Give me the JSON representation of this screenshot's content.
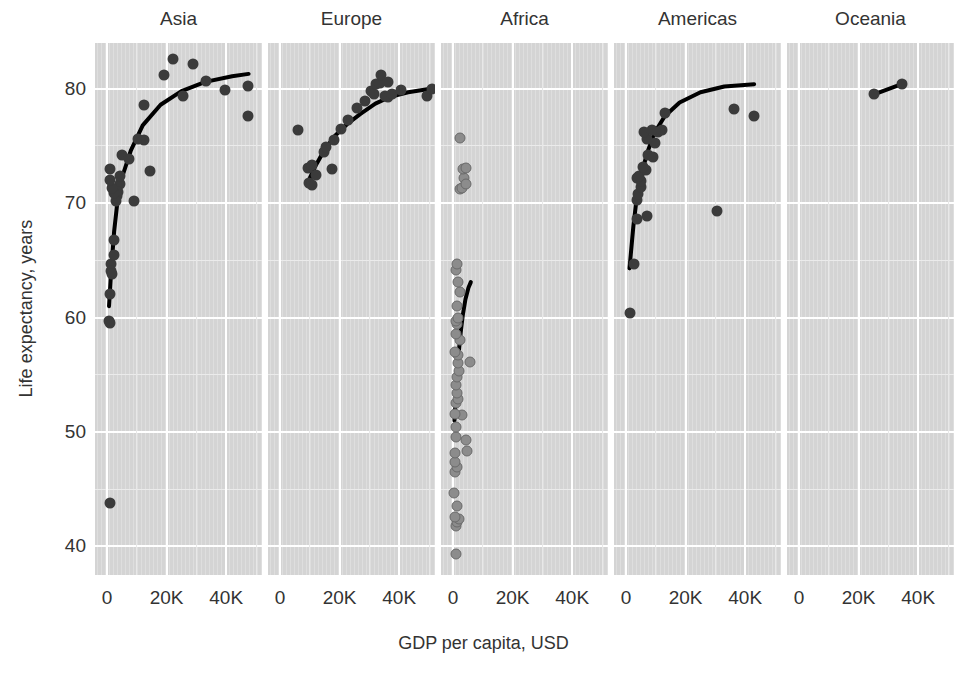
{
  "chart_data": {
    "type": "scatter",
    "title": "",
    "xlabel": "GDP per capita, USD",
    "ylabel": "Life expectancy, years",
    "xlim": [
      -4000,
      52000
    ],
    "ylim": [
      37.5,
      84
    ],
    "xticks": [
      0,
      20000,
      40000
    ],
    "xticklabels": [
      "0",
      "20K",
      "40K"
    ],
    "yticks": [
      40,
      50,
      60,
      70,
      80
    ],
    "yticklabels": [
      "40",
      "50",
      "60",
      "70",
      "80"
    ],
    "grid": true,
    "legend": "none",
    "facet_by": "continent",
    "point_color_dark": "#3b3b3b",
    "point_color_mid": "#8c8c8c",
    "trend_color": "#000000",
    "panel_background": "#d4d4d4",
    "gridline_color": "#ffffff",
    "facets": [
      {
        "name": "Asia",
        "label": "Asia",
        "point_style": "dark",
        "points": [
          {
            "x": 975,
            "y": 43.8
          },
          {
            "x": 1391,
            "y": 64.7
          },
          {
            "x": 1441,
            "y": 64.1
          },
          {
            "x": 944,
            "y": 62.1
          },
          {
            "x": 2452,
            "y": 65.5
          },
          {
            "x": 1593,
            "y": 63.8
          },
          {
            "x": 706,
            "y": 59.7
          },
          {
            "x": 1056,
            "y": 59.5
          },
          {
            "x": 2441,
            "y": 66.8
          },
          {
            "x": 3540,
            "y": 70.6
          },
          {
            "x": 4471,
            "y": 71.7
          },
          {
            "x": 4519,
            "y": 72.4
          },
          {
            "x": 3823,
            "y": 71.0
          },
          {
            "x": 2983,
            "y": 70.2
          },
          {
            "x": 2280,
            "y": 70.9
          },
          {
            "x": 1713,
            "y": 71.3
          },
          {
            "x": 1107,
            "y": 72.0
          },
          {
            "x": 1042,
            "y": 73.0
          },
          {
            "x": 4959,
            "y": 74.2
          },
          {
            "x": 7458,
            "y": 73.9
          },
          {
            "x": 10461,
            "y": 75.6
          },
          {
            "x": 12452,
            "y": 75.5
          },
          {
            "x": 14599,
            "y": 72.8
          },
          {
            "x": 9065,
            "y": 70.2
          },
          {
            "x": 12546,
            "y": 78.6
          },
          {
            "x": 18977,
            "y": 81.2
          },
          {
            "x": 22316,
            "y": 82.6
          },
          {
            "x": 28718,
            "y": 82.2
          },
          {
            "x": 25523,
            "y": 79.4
          },
          {
            "x": 33207,
            "y": 80.7
          },
          {
            "x": 39725,
            "y": 79.9
          },
          {
            "x": 47307,
            "y": 80.2
          },
          {
            "x": 47143,
            "y": 77.6
          }
        ],
        "trend": [
          {
            "x": 700,
            "y": 61.0
          },
          {
            "x": 1400,
            "y": 64.0
          },
          {
            "x": 2400,
            "y": 67.5
          },
          {
            "x": 3600,
            "y": 70.3
          },
          {
            "x": 5000,
            "y": 72.2
          },
          {
            "x": 8000,
            "y": 74.6
          },
          {
            "x": 12000,
            "y": 76.8
          },
          {
            "x": 18000,
            "y": 78.6
          },
          {
            "x": 25000,
            "y": 79.8
          },
          {
            "x": 33000,
            "y": 80.6
          },
          {
            "x": 42000,
            "y": 81.1
          },
          {
            "x": 47500,
            "y": 81.3
          }
        ]
      },
      {
        "name": "Europe",
        "label": "Europe",
        "point_style": "dark",
        "points": [
          {
            "x": 5937,
            "y": 76.4
          },
          {
            "x": 9786,
            "y": 71.8
          },
          {
            "x": 10681,
            "y": 71.6
          },
          {
            "x": 9410,
            "y": 73.1
          },
          {
            "x": 10808,
            "y": 73.3
          },
          {
            "x": 12154,
            "y": 72.5
          },
          {
            "x": 14619,
            "y": 74.5
          },
          {
            "x": 15463,
            "y": 74.9
          },
          {
            "x": 17356,
            "y": 73.0
          },
          {
            "x": 18008,
            "y": 75.5
          },
          {
            "x": 20510,
            "y": 76.5
          },
          {
            "x": 22833,
            "y": 77.3
          },
          {
            "x": 25768,
            "y": 78.3
          },
          {
            "x": 28569,
            "y": 78.9
          },
          {
            "x": 30470,
            "y": 79.8
          },
          {
            "x": 31656,
            "y": 79.5
          },
          {
            "x": 32170,
            "y": 80.4
          },
          {
            "x": 33693,
            "y": 80.5
          },
          {
            "x": 33860,
            "y": 81.2
          },
          {
            "x": 35278,
            "y": 79.4
          },
          {
            "x": 36126,
            "y": 79.3
          },
          {
            "x": 36181,
            "y": 80.6
          },
          {
            "x": 37506,
            "y": 79.5
          },
          {
            "x": 40676,
            "y": 79.9
          },
          {
            "x": 49357,
            "y": 79.4
          },
          {
            "x": 51000,
            "y": 80.0
          }
        ],
        "trend": [
          {
            "x": 9500,
            "y": 71.9
          },
          {
            "x": 12000,
            "y": 73.3
          },
          {
            "x": 15000,
            "y": 74.7
          },
          {
            "x": 18500,
            "y": 75.9
          },
          {
            "x": 22500,
            "y": 76.9
          },
          {
            "x": 27000,
            "y": 77.8
          },
          {
            "x": 32000,
            "y": 78.7
          },
          {
            "x": 37000,
            "y": 79.3
          },
          {
            "x": 43000,
            "y": 79.7
          },
          {
            "x": 50500,
            "y": 80.0
          }
        ]
      },
      {
        "name": "Africa",
        "label": "Africa",
        "point_style": "mid",
        "points": [
          {
            "x": 863,
            "y": 39.3
          },
          {
            "x": 1056,
            "y": 41.8
          },
          {
            "x": 1217,
            "y": 42.1
          },
          {
            "x": 2013,
            "y": 42.4
          },
          {
            "x": 690,
            "y": 42.6
          },
          {
            "x": 1271,
            "y": 43.5
          },
          {
            "x": 430,
            "y": 44.7
          },
          {
            "x": 613,
            "y": 46.5
          },
          {
            "x": 1271,
            "y": 46.9
          },
          {
            "x": 706,
            "y": 47.4
          },
          {
            "x": 823,
            "y": 48.2
          },
          {
            "x": 4797,
            "y": 48.3
          },
          {
            "x": 4513,
            "y": 49.3
          },
          {
            "x": 1056,
            "y": 49.6
          },
          {
            "x": 1178,
            "y": 50.4
          },
          {
            "x": 3025,
            "y": 51.5
          },
          {
            "x": 641,
            "y": 51.6
          },
          {
            "x": 926,
            "y": 52.5
          },
          {
            "x": 1544,
            "y": 52.9
          },
          {
            "x": 1327,
            "y": 53.4
          },
          {
            "x": 1093,
            "y": 54.1
          },
          {
            "x": 1271,
            "y": 54.8
          },
          {
            "x": 2082,
            "y": 55.3
          },
          {
            "x": 1598,
            "y": 56.0
          },
          {
            "x": 1544,
            "y": 56.7
          },
          {
            "x": 619,
            "y": 57.0
          },
          {
            "x": 2452,
            "y": 58.0
          },
          {
            "x": 5581,
            "y": 56.1
          },
          {
            "x": 1107,
            "y": 58.6
          },
          {
            "x": 1441,
            "y": 59.4
          },
          {
            "x": 863,
            "y": 59.7
          },
          {
            "x": 1569,
            "y": 60.0
          },
          {
            "x": 1327,
            "y": 61.0
          },
          {
            "x": 2280,
            "y": 62.2
          },
          {
            "x": 1598,
            "y": 63.1
          },
          {
            "x": 944,
            "y": 64.2
          },
          {
            "x": 1217,
            "y": 64.7
          },
          {
            "x": 2441,
            "y": 71.2
          },
          {
            "x": 2983,
            "y": 71.3
          },
          {
            "x": 3822,
            "y": 72.2
          },
          {
            "x": 4472,
            "y": 71.7
          },
          {
            "x": 3540,
            "y": 73.0
          },
          {
            "x": 4519,
            "y": 73.1
          },
          {
            "x": 2441,
            "y": 75.7
          }
        ],
        "trend": [
          {
            "x": 500,
            "y": 51.0
          },
          {
            "x": 800,
            "y": 52.4
          },
          {
            "x": 1100,
            "y": 53.8
          },
          {
            "x": 1500,
            "y": 55.4
          },
          {
            "x": 2000,
            "y": 57.1
          },
          {
            "x": 2600,
            "y": 58.7
          },
          {
            "x": 3300,
            "y": 60.2
          },
          {
            "x": 4200,
            "y": 61.6
          },
          {
            "x": 5200,
            "y": 62.6
          },
          {
            "x": 6000,
            "y": 63.1
          }
        ]
      },
      {
        "name": "Americas",
        "label": "Americas",
        "point_style": "dark",
        "points": [
          {
            "x": 1201,
            "y": 60.4
          },
          {
            "x": 2749,
            "y": 64.7
          },
          {
            "x": 3548,
            "y": 68.6
          },
          {
            "x": 3822,
            "y": 70.3
          },
          {
            "x": 4172,
            "y": 70.8
          },
          {
            "x": 4959,
            "y": 71.4
          },
          {
            "x": 5186,
            "y": 71.9
          },
          {
            "x": 3632,
            "y": 72.2
          },
          {
            "x": 4519,
            "y": 72.4
          },
          {
            "x": 7009,
            "y": 68.9
          },
          {
            "x": 6873,
            "y": 72.9
          },
          {
            "x": 5728,
            "y": 73.2
          },
          {
            "x": 7320,
            "y": 74.2
          },
          {
            "x": 8948,
            "y": 74.0
          },
          {
            "x": 9645,
            "y": 75.3
          },
          {
            "x": 7006,
            "y": 75.6
          },
          {
            "x": 5937,
            "y": 76.2
          },
          {
            "x": 8796,
            "y": 76.4
          },
          {
            "x": 10611,
            "y": 76.2
          },
          {
            "x": 11978,
            "y": 76.4
          },
          {
            "x": 13171,
            "y": 77.9
          },
          {
            "x": 36319,
            "y": 78.2
          },
          {
            "x": 42952,
            "y": 77.6
          },
          {
            "x": 30487,
            "y": 69.3
          }
        ],
        "trend": [
          {
            "x": 1200,
            "y": 64.3
          },
          {
            "x": 2500,
            "y": 68.0
          },
          {
            "x": 3600,
            "y": 70.4
          },
          {
            "x": 5000,
            "y": 72.3
          },
          {
            "x": 7000,
            "y": 74.3
          },
          {
            "x": 9500,
            "y": 76.1
          },
          {
            "x": 13000,
            "y": 77.6
          },
          {
            "x": 18000,
            "y": 78.8
          },
          {
            "x": 25000,
            "y": 79.7
          },
          {
            "x": 33000,
            "y": 80.2
          },
          {
            "x": 43000,
            "y": 80.4
          }
        ]
      },
      {
        "name": "Oceania",
        "label": "Oceania",
        "point_style": "dark",
        "points": [
          {
            "x": 25185,
            "y": 79.5
          },
          {
            "x": 34435,
            "y": 80.4
          }
        ],
        "trend": [
          {
            "x": 25185,
            "y": 79.5
          },
          {
            "x": 34435,
            "y": 80.4
          }
        ]
      }
    ]
  }
}
